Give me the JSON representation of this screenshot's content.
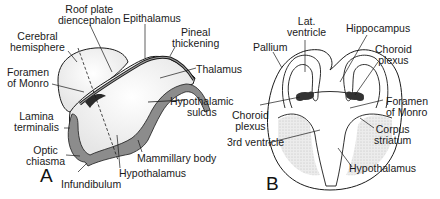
{
  "figure": {
    "panel_a": {
      "letter": "A",
      "labels": {
        "roof_plate": "Roof plate\ndiencephalon",
        "epithalamus": "Epithalamus",
        "cerebral_hemisphere": "Cerebral\nhemisphere",
        "pineal_thickening": "Pineal\nthickening",
        "foramen_of_monro": "Foramen\nof Monro",
        "thalamus": "Thalamus",
        "hypothalamic_sulcus": "Hypothalamic\nsulcus",
        "lamina_terminalis": "Lamina\nterminalis",
        "optic_chiasma": "Optic\nchiasma",
        "mammillary_body": "Mammillary body",
        "hypothalamus": "Hypothalamus",
        "infundibulum": "Infundibulum"
      }
    },
    "panel_b": {
      "letter": "B",
      "labels": {
        "lat_ventricle": "Lat.\nventricle",
        "hippocampus": "Hippocampus",
        "pallium": "Pallium",
        "choroid_plexus_top": "Choroid\nplexus",
        "foramen_of_monro": "Foramen\nof Monro",
        "choroid_plexus_left": "Choroid\nplexus",
        "corpus_striatum": "Corpus\nstriatum",
        "third_ventricle": "3rd ventricle",
        "hypothalamus": "Hypothalamus"
      }
    },
    "colors": {
      "outline": "#1a1a1a",
      "wall_fill": "#8c8c8c",
      "stipple": "#d9d9d9",
      "background": "#ffffff"
    }
  }
}
